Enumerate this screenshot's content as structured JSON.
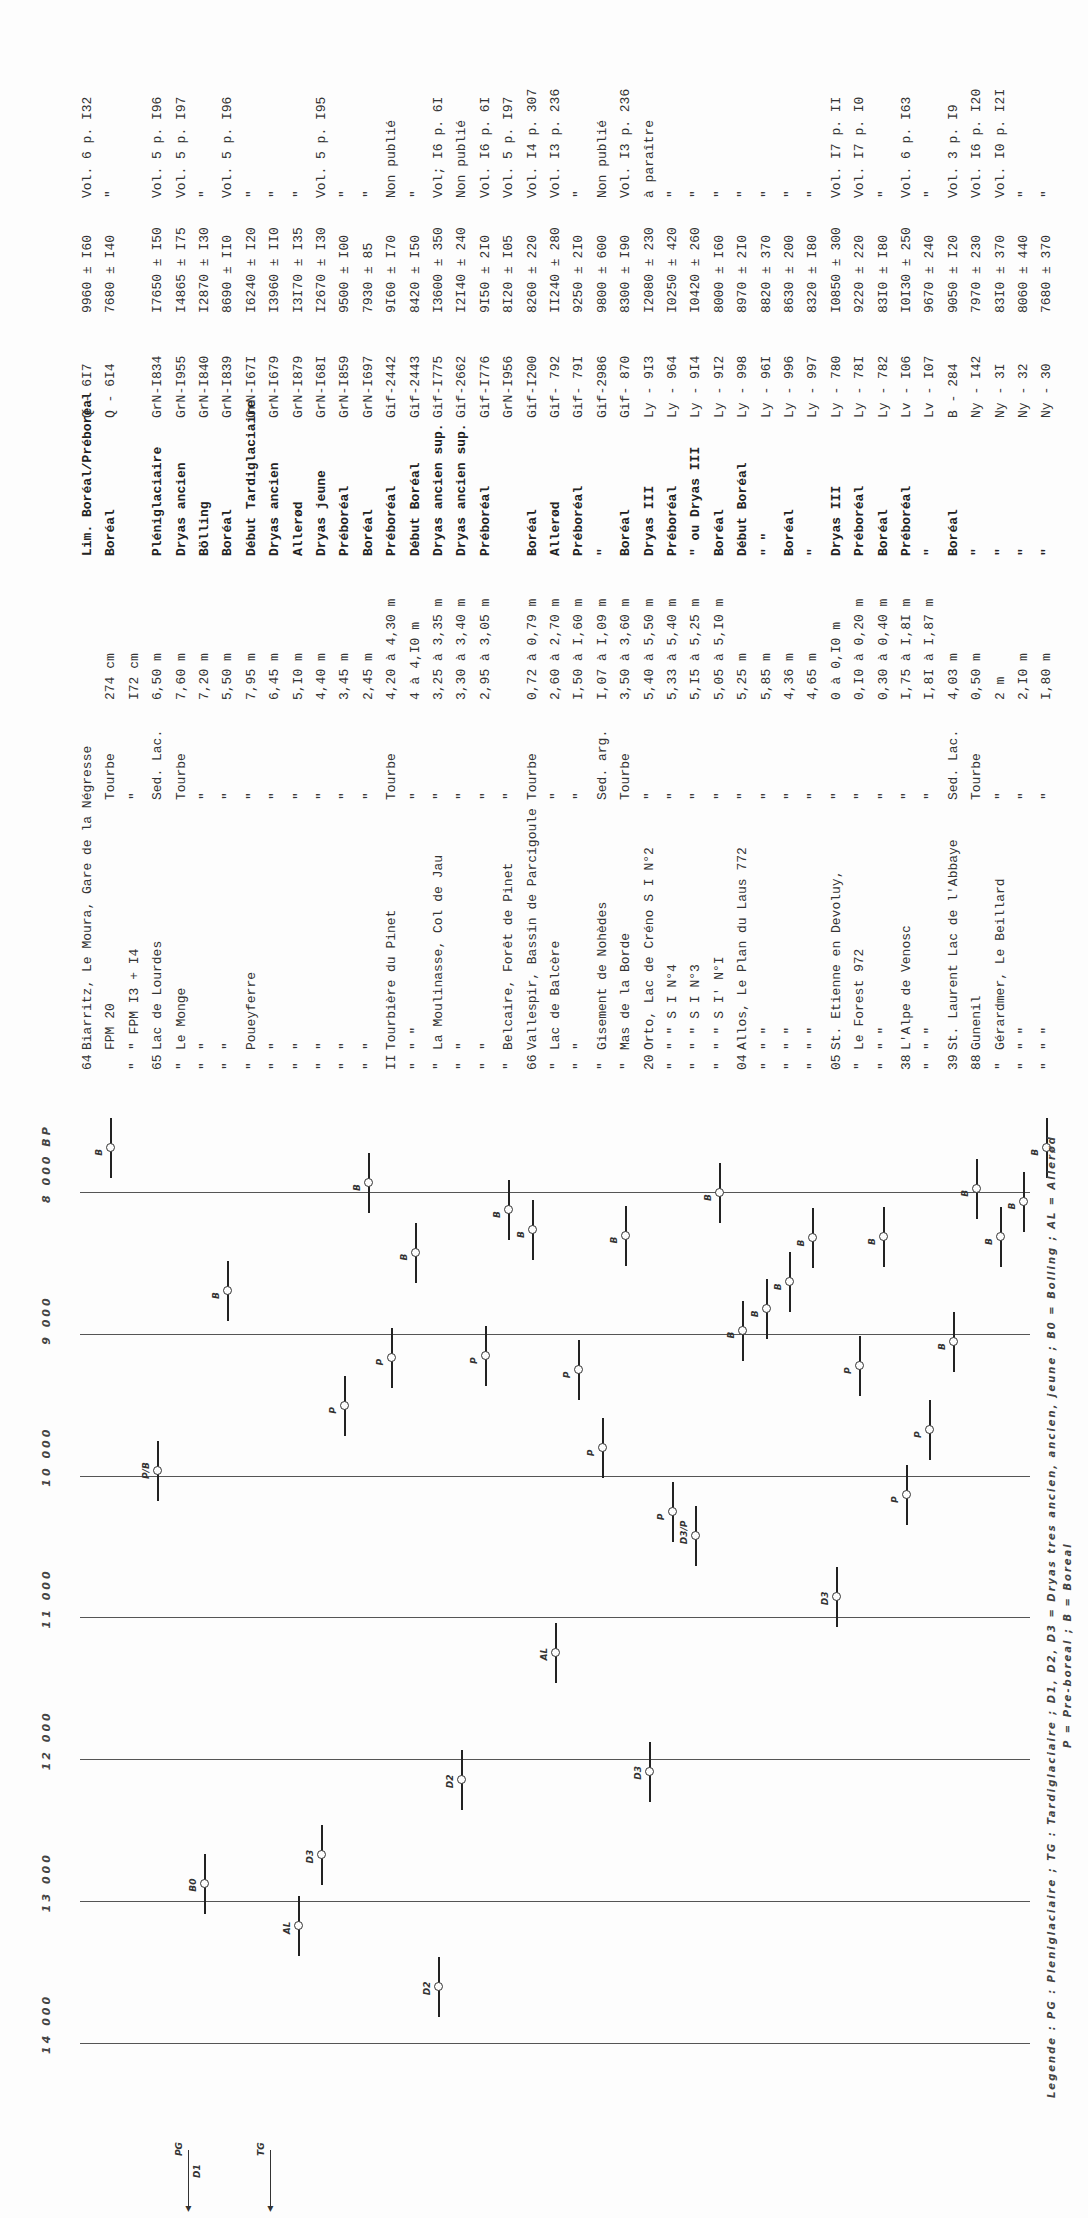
{
  "table": {
    "rows": [
      {
        "num": "64",
        "name": "Biarritz, Le Moura, Gare de la Négresse",
        "material": "",
        "depth": "",
        "period": "Lim. Boréal/Préboréal",
        "lab": "Q - 6I7",
        "date": "9960 ± I60",
        "ref": "Vol. 6 p. I32"
      },
      {
        "num": "",
        "name": "        FPM 20",
        "material": "Tourbe",
        "depth": "274 cm",
        "period": "Boréal",
        "lab": "Q - 6I4",
        "date": "7680 ± I40",
        "ref": "\""
      },
      {
        "num": "\"",
        "name": "\"      FPM I3 + I4",
        "material": "\"",
        "depth": "I72 cm",
        "period": "",
        "lab": "",
        "date": "",
        "ref": ""
      },
      {
        "num": "65",
        "name": "Lac de Lourdes",
        "material": "Sed. Lac.",
        "depth": "6,50 m",
        "period": "Pléniglaciaire",
        "lab": "GrN-I834",
        "date": "I7650 ± I50",
        "ref": "Vol. 5 p. I96"
      },
      {
        "num": "\"",
        "name": "Le Monge",
        "material": "Tourbe",
        "depth": "7,60 m",
        "period": "Dryas ancien",
        "lab": "GrN-I955",
        "date": "I4865 ± I75",
        "ref": "Vol. 5 p. I97"
      },
      {
        "num": "\"",
        "name": "\"",
        "material": "\"",
        "depth": "7,20 m",
        "period": "Bölling",
        "lab": "GrN-I840",
        "date": "I2870 ± I30",
        "ref": "\""
      },
      {
        "num": "\"",
        "name": "\"",
        "material": "\"",
        "depth": "5,50 m",
        "period": "Boréal",
        "lab": "GrN-I839",
        "date": "8690 ± II0",
        "ref": "Vol. 5 p. I96"
      },
      {
        "num": "\"",
        "name": "Poueyferre",
        "material": "\"",
        "depth": "7,95 m",
        "period": "Début Tardiglaciaire",
        "lab": "GrN-I67I",
        "date": "I6240 ± I20",
        "ref": "\""
      },
      {
        "num": "\"",
        "name": "\"",
        "material": "\"",
        "depth": "6,45 m",
        "period": "Dryas ancien",
        "lab": "GrN-I679",
        "date": "I3960 ± II0",
        "ref": "\""
      },
      {
        "num": "\"",
        "name": "\"",
        "material": "\"",
        "depth": "5,I0 m",
        "period": "Allerød",
        "lab": "GrN-I879",
        "date": "I3I70 ± I35",
        "ref": "\""
      },
      {
        "num": "\"",
        "name": "\"",
        "material": "\"",
        "depth": "4,40 m",
        "period": "Dryas jeune",
        "lab": "GrN-I68I",
        "date": "I2670 ± I30",
        "ref": "Vol. 5 p. I95"
      },
      {
        "num": "\"",
        "name": "\"",
        "material": "\"",
        "depth": "3,45 m",
        "period": "Préboréal",
        "lab": "GrN-I859",
        "date": "9500 ± I00",
        "ref": "\""
      },
      {
        "num": "\"",
        "name": "\"",
        "material": "\"",
        "depth": "2,45 m",
        "period": "Boréal",
        "lab": "GrN-I697",
        "date": "7930 ± 85",
        "ref": "\""
      },
      {
        "num": "II",
        "name": "Tourbière du Pinet",
        "material": "Tourbe",
        "depth": "4,20 à 4,30 m",
        "period": "Préboréal",
        "lab": "Gif-2442",
        "date": "9I60 ± I70",
        "ref": "Non publié"
      },
      {
        "num": "\"",
        "name": "\"       \"",
        "material": "\"",
        "depth": "4   à 4,I0 m",
        "period": "Début Boréal",
        "lab": "Gif-2443",
        "date": "8420 ± I50",
        "ref": "\""
      },
      {
        "num": "\"",
        "name": "La Moulinasse, Col de Jau",
        "material": "\"",
        "depth": "3,25 à 3,35 m",
        "period": "Dryas ancien sup.",
        "lab": "Gif-I775",
        "date": "I3600 ± 350",
        "ref": "Vol; I6 p. 6I"
      },
      {
        "num": "\"",
        "name": "\"",
        "material": "\"",
        "depth": "3,30 à 3,40 m",
        "period": "Dryas ancien sup.",
        "lab": "Gif-2662",
        "date": "I2I40 ± 240",
        "ref": "Non publié"
      },
      {
        "num": "\"",
        "name": "\"",
        "material": "\"",
        "depth": "2,95 à 3,05 m",
        "period": "Préboréal",
        "lab": "Gif-I776",
        "date": "9I50 ± 2I0",
        "ref": "Vol. I6 p. 6I"
      },
      {
        "num": "\"",
        "name": "Belcaire, Forêt de Pinet",
        "material": "\"",
        "depth": "",
        "period": "",
        "lab": "GrN-I956",
        "date": "8I20 ± I05",
        "ref": "Vol. 5 p. I97"
      },
      {
        "num": "66",
        "name": "Vallespir, Bassin de Parcigoule",
        "material": "Tourbe",
        "depth": "0,72 à 0,79 m",
        "period": "Boréal",
        "lab": "Gif-I200",
        "date": "8260 ± 220",
        "ref": "Vol. I4 p. 307"
      },
      {
        "num": "\"",
        "name": "Lac de Balcère",
        "material": "\"",
        "depth": "2,60 à 2,70 m",
        "period": "Allerød",
        "lab": "Gif- 792",
        "date": "II240 ± 280",
        "ref": "Vol. I3 p. 236"
      },
      {
        "num": "\"",
        "name": "\"",
        "material": "\"",
        "depth": "I,50 à I,60 m",
        "period": "Préboréal",
        "lab": "Gif- 79I",
        "date": "9250 ± 2I0",
        "ref": "\""
      },
      {
        "num": "\"",
        "name": "Gisement de Nohèdes",
        "material": "Sed. arg.",
        "depth": "I,07 à I,09 m",
        "period": "\"",
        "lab": "Gif-2986",
        "date": "9800 ± 600",
        "ref": "Non publié"
      },
      {
        "num": "\"",
        "name": "Mas de la Borde",
        "material": "Tourbe",
        "depth": "3,50 à 3,60 m",
        "period": "Boréal",
        "lab": "Gif- 870",
        "date": "8300 ± I90",
        "ref": "Vol. I3 p. 236"
      },
      {
        "num": "20",
        "name": "Orto, Lac de Créno   S I  N°2",
        "material": "\"",
        "depth": "5,40 à 5,50 m",
        "period": "Dryas III",
        "lab": "Ly - 9I3",
        "date": "I2080 ± 230",
        "ref": "à paraître"
      },
      {
        "num": "\"",
        "name": "\"      \"        S I  N°4",
        "material": "\"",
        "depth": "5,33 à 5,40 m",
        "period": "Préboréal",
        "lab": "Ly - 964",
        "date": "I0250 ± 420",
        "ref": "\""
      },
      {
        "num": "\"",
        "name": "\"      \"        S I  N°3",
        "material": "\"",
        "depth": "5,I5 à 5,25 m",
        "period": "\"    ou Dryas III",
        "lab": "Ly - 9I4",
        "date": "I0420 ± 260",
        "ref": "\""
      },
      {
        "num": "\"",
        "name": "\"      \"        S I' N°I",
        "material": "\"",
        "depth": "5,05 à 5,I0 m",
        "period": "Boréal",
        "lab": "Ly - 9I2",
        "date": "8000 ± I60",
        "ref": "\""
      },
      {
        "num": "04",
        "name": "Allos, Le Plan du Laus 772",
        "material": "\"",
        "depth": "5,25 m",
        "period": "Début Boréal",
        "lab": "Ly - 998",
        "date": "8970 ± 2I0",
        "ref": "\""
      },
      {
        "num": "\"",
        "name": "\"     \"",
        "material": "\"",
        "depth": "5,85 m",
        "period": "\"   \"",
        "lab": "Ly - 96I",
        "date": "8820 ± 370",
        "ref": "\""
      },
      {
        "num": "\"",
        "name": "\"     \"",
        "material": "\"",
        "depth": "4,36 m",
        "period": "Boréal",
        "lab": "Ly - 996",
        "date": "8630 ± 200",
        "ref": "\""
      },
      {
        "num": "\"",
        "name": "\"     \"",
        "material": "\"",
        "depth": "4,65 m",
        "period": "\"",
        "lab": "Ly - 997",
        "date": "8320 ± I80",
        "ref": "\""
      },
      {
        "num": "05",
        "name": "St. Etienne en Devoluy,",
        "material": "\"",
        "depth": "0   à 0,I0 m",
        "period": "Dryas III",
        "lab": "Ly - 780",
        "date": "I0850 ± 300",
        "ref": "Vol. I7 p. II"
      },
      {
        "num": "\"",
        "name": "   Le Forest 972",
        "material": "\"",
        "depth": "0,I0 à 0,20 m",
        "period": "Préboréal",
        "lab": "Ly - 78I",
        "date": "9220 ± 220",
        "ref": "Vol. I7 p. I0"
      },
      {
        "num": "\"",
        "name": "   \"     \"",
        "material": "\"",
        "depth": "0,30 à 0,40 m",
        "period": "Boréal",
        "lab": "Ly - 782",
        "date": "83I0 ± I80",
        "ref": "\""
      },
      {
        "num": "38",
        "name": "L'Alpe de Venosc",
        "material": "\"",
        "depth": "I,75 à I,8I m",
        "period": "Préboréal",
        "lab": "Lv - I06",
        "date": "I0I30 ± 250",
        "ref": "Vol. 6 p. I63"
      },
      {
        "num": "\"",
        "name": "\"    \"",
        "material": "\"",
        "depth": "I,8I à I,87 m",
        "period": "\"",
        "lab": "Lv - I07",
        "date": "9670 ± 240",
        "ref": "\""
      },
      {
        "num": "39",
        "name": "St. Laurent Lac de l'Abbaye",
        "material": "Sed. Lac.",
        "depth": "4,03 m",
        "period": "Boréal",
        "lab": "B  - 284",
        "date": "9050 ± I20",
        "ref": "Vol. 3 p. I9"
      },
      {
        "num": "88",
        "name": "Gunenil",
        "material": "Tourbe",
        "depth": "0,50 m",
        "period": "\"",
        "lab": "Ny - I42",
        "date": "7970 ± 230",
        "ref": "Vol. I6 p. I20"
      },
      {
        "num": "\"",
        "name": "Gérardmer, Le Beillard",
        "material": "\"",
        "depth": "2 m",
        "period": "\"",
        "lab": "Ny - 3I",
        "date": "83I0 ± 370",
        "ref": "Vol. I0 p. I2I"
      },
      {
        "num": "\"",
        "name": "\"     \"",
        "material": "\"",
        "depth": "2,I0 m",
        "period": "\"",
        "lab": "Ny - 32",
        "date": "8060 ± 440",
        "ref": "\""
      },
      {
        "num": "\"",
        "name": "\"     \"",
        "material": "\"",
        "depth": "I,80 m",
        "period": "\"",
        "lab": "Ny - 30",
        "date": "7680 ± 370",
        "ref": "\""
      }
    ]
  },
  "chart": {
    "axis_ticks": [
      {
        "label": "8 000 BP",
        "value": 8000
      },
      {
        "label": "9 000",
        "value": 9000
      },
      {
        "label": "10 000",
        "value": 10000
      },
      {
        "label": "11 000",
        "value": 11000
      },
      {
        "label": "12 000",
        "value": 12000
      },
      {
        "label": "13 000",
        "value": 13000
      },
      {
        "label": "14 000",
        "value": 14000
      }
    ],
    "markers": [
      {
        "row": 1,
        "label": "B",
        "value": 7680
      },
      {
        "row": 3,
        "label": "P/B",
        "value": 9960
      },
      {
        "row": 5,
        "label": "B0",
        "value": 12870
      },
      {
        "row": 6,
        "label": "B",
        "value": 8690
      },
      {
        "row": 7,
        "label": "D1",
        "value": 16240
      },
      {
        "row": 9,
        "label": "AL",
        "value": 13170
      },
      {
        "row": 10,
        "label": "D3",
        "value": 12670
      },
      {
        "row": 11,
        "label": "P",
        "value": 9500
      },
      {
        "row": 12,
        "label": "B",
        "value": 7930
      },
      {
        "row": 13,
        "label": "P",
        "value": 9160
      },
      {
        "row": 14,
        "label": "B",
        "value": 8420
      },
      {
        "row": 15,
        "label": "D2",
        "value": 13600
      },
      {
        "row": 16,
        "label": "D2",
        "value": 12140
      },
      {
        "row": 17,
        "label": "P",
        "value": 9150
      },
      {
        "row": 18,
        "label": "B",
        "value": 8120
      },
      {
        "row": 19,
        "label": "B",
        "value": 8260
      },
      {
        "row": 20,
        "label": "AL",
        "value": 11240
      },
      {
        "row": 21,
        "label": "P",
        "value": 9250
      },
      {
        "row": 22,
        "label": "P",
        "value": 9800
      },
      {
        "row": 23,
        "label": "B",
        "value": 8300
      },
      {
        "row": 24,
        "label": "D3",
        "value": 12080
      },
      {
        "row": 25,
        "label": "P",
        "value": 10250
      },
      {
        "row": 26,
        "label": "D3/P",
        "value": 10420
      },
      {
        "row": 27,
        "label": "B",
        "value": 8000
      },
      {
        "row": 28,
        "label": "B",
        "value": 8970
      },
      {
        "row": 29,
        "label": "B",
        "value": 8820
      },
      {
        "row": 30,
        "label": "B",
        "value": 8630
      },
      {
        "row": 31,
        "label": "B",
        "value": 8320
      },
      {
        "row": 32,
        "label": "D3",
        "value": 10850
      },
      {
        "row": 33,
        "label": "P",
        "value": 9220
      },
      {
        "row": 34,
        "label": "B",
        "value": 8310
      },
      {
        "row": 35,
        "label": "P",
        "value": 10130
      },
      {
        "row": 36,
        "label": "P",
        "value": 9670
      },
      {
        "row": 37,
        "label": "B",
        "value": 9050
      },
      {
        "row": 38,
        "label": "B",
        "value": 7970
      },
      {
        "row": 39,
        "label": "B",
        "value": 8310
      },
      {
        "row": 40,
        "label": "B",
        "value": 8060
      },
      {
        "row": 41,
        "label": "B",
        "value": 7680
      }
    ],
    "arrows": [
      {
        "label": "PG",
        "sub": "D1"
      },
      {
        "label": "TG",
        "sub": ""
      }
    ]
  },
  "legend": {
    "line1": "Legende : PG : Pleniglaciaire ; TG : Tardiglaciaire ; D1, D2, D3 = Dryas tres ancien, ancien, jeune ;  B0 = Bolling ; AL = Allerød",
    "line2": "P = Pre-boreal ; B = Boreal"
  }
}
